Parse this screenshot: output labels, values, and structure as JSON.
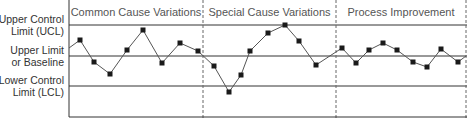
{
  "chart_data": {
    "type": "line",
    "title": "",
    "xlabel": "",
    "ylabel": "",
    "grid": false,
    "legend": null,
    "control_lines": [
      {
        "name": "Upper Control Limit (UCL)",
        "line1": "Upper Control",
        "line2": "Limit (UCL)",
        "y_px": 25
      },
      {
        "name": "Upper Limit or Baseline",
        "line1": "Upper Limit",
        "line2": "or Baseline",
        "y_px": 56
      },
      {
        "name": "Lower Control Limit (LCL)",
        "line1": "Lower Control",
        "line2": "Limit (LCL)",
        "y_px": 86
      }
    ],
    "sections": [
      {
        "label": "Common Cause Variations",
        "x_start": 69,
        "x_end": 203
      },
      {
        "label": "Special Cause Variations",
        "x_start": 203,
        "x_end": 336
      },
      {
        "label": "Process Improvement",
        "x_start": 336,
        "x_end": 466
      }
    ],
    "series": [
      {
        "name": "Process measurement",
        "points_px": [
          [
            69,
            48
          ],
          [
            80,
            40
          ],
          [
            94,
            62
          ],
          [
            110,
            74
          ],
          [
            127,
            50
          ],
          [
            143,
            30
          ],
          [
            162,
            63
          ],
          [
            180,
            43
          ],
          [
            198,
            51
          ],
          [
            214,
            66
          ],
          [
            229,
            92
          ],
          [
            241,
            75
          ],
          [
            250,
            51
          ],
          [
            268,
            33
          ],
          [
            285,
            25
          ],
          [
            299,
            41
          ],
          [
            316,
            65
          ],
          [
            342,
            48
          ],
          [
            356,
            63
          ],
          [
            369,
            50
          ],
          [
            383,
            43
          ],
          [
            397,
            50
          ],
          [
            413,
            62
          ],
          [
            427,
            67
          ],
          [
            441,
            49
          ],
          [
            458,
            62
          ],
          [
            466,
            56
          ]
        ],
        "markers_from_index": 1,
        "markers_to_index": 25
      }
    ],
    "axis": {
      "left_x": 69,
      "top_y": 0,
      "bottom_y": 117,
      "right_x": 466
    }
  },
  "colors": {
    "line": "#555555",
    "marker": "#1a1a1a",
    "axis": "#333333",
    "divider": "#666666",
    "section_text": "#555555",
    "label_text": "#333333"
  }
}
